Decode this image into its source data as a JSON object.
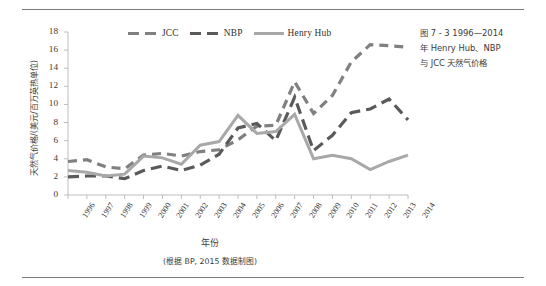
{
  "figure": {
    "caption_lines": [
      "图 7 - 3   1996—2014",
      "年 Henry Hub、NBP",
      "与 JCC 天然气价格"
    ],
    "source_note": "(根据 BP, 2015 数据制图)"
  },
  "legend": {
    "position": "top-center",
    "items": [
      {
        "label": "JCC",
        "color": "#808080",
        "style": "dashed"
      },
      {
        "label": "NBP",
        "color": "#5a5a5a",
        "style": "dashed"
      },
      {
        "label": "Henry Hub",
        "color": "#a8a8a8",
        "style": "solid"
      }
    ]
  },
  "chart_data": {
    "type": "line",
    "title": "",
    "subtitle": "",
    "xlabel": "年份",
    "ylabel": "天然气价格/(美元/百万英热单位)",
    "xlim": [
      1996,
      2014
    ],
    "ylim": [
      0,
      18
    ],
    "yticks": [
      0,
      2,
      4,
      6,
      8,
      10,
      12,
      14,
      16,
      18
    ],
    "grid": false,
    "categories": [
      "1996",
      "1997",
      "1998",
      "1999",
      "2000",
      "2001",
      "2002",
      "2003",
      "2004",
      "2005",
      "2006",
      "2007",
      "2008",
      "2009",
      "2010",
      "2011",
      "2012",
      "2013",
      "2014"
    ],
    "x": [
      1996,
      1997,
      1998,
      1999,
      2000,
      2001,
      2002,
      2003,
      2004,
      2005,
      2006,
      2007,
      2008,
      2009,
      2010,
      2011,
      2012,
      2013,
      2014
    ],
    "series": [
      {
        "name": "JCC",
        "color": "#808080",
        "style": "dashed",
        "values": [
          3.7,
          3.9,
          3.1,
          2.9,
          4.4,
          4.6,
          4.3,
          4.8,
          5.0,
          6.1,
          7.6,
          7.7,
          12.5,
          9.0,
          11.0,
          14.7,
          16.6,
          16.5,
          16.3
        ]
      },
      {
        "name": "NBP",
        "color": "#5a5a5a",
        "style": "dashed",
        "values": [
          2.0,
          2.1,
          2.1,
          1.8,
          2.7,
          3.2,
          2.7,
          3.3,
          4.5,
          7.4,
          7.9,
          6.0,
          10.8,
          4.9,
          6.6,
          9.1,
          9.5,
          10.6,
          8.3
        ]
      },
      {
        "name": "Henry Hub",
        "color": "#a8a8a8",
        "style": "solid",
        "values": [
          2.7,
          2.5,
          2.1,
          2.3,
          4.3,
          4.1,
          3.4,
          5.5,
          5.9,
          8.8,
          6.8,
          7.0,
          8.9,
          4.0,
          4.4,
          4.0,
          2.8,
          3.7,
          4.4
        ]
      }
    ],
    "annotations": []
  },
  "axes": {
    "y_tick_labels": [
      "18",
      "16",
      "14",
      "12",
      "10",
      "8",
      "6",
      "4",
      "2",
      "0"
    ],
    "x_tick_labels": [
      "1996",
      "1997",
      "1998",
      "1999",
      "2000",
      "2001",
      "2002",
      "2003",
      "2004",
      "2005",
      "2006",
      "2007",
      "2008",
      "2009",
      "2010",
      "2011",
      "2012",
      "2013",
      "2014"
    ]
  }
}
